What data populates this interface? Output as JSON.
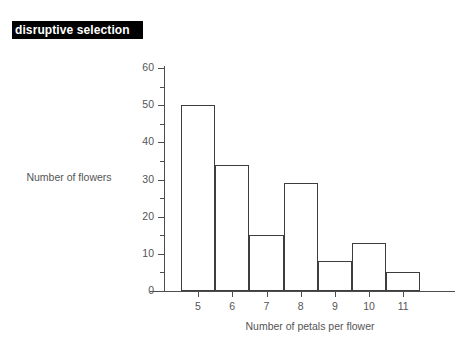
{
  "banner": {
    "title": "disruptive selection"
  },
  "chart_data": {
    "type": "bar",
    "title": "disruptive selection",
    "categories": [
      "5",
      "6",
      "7",
      "8",
      "9",
      "10",
      "11"
    ],
    "values": [
      50,
      34,
      15,
      29,
      8,
      13,
      5
    ],
    "xlabel": "Number of petals per flower",
    "ylabel": "Number of flowers",
    "ylim": [
      0,
      60
    ],
    "ytick_labels": [
      "0",
      "10",
      "20",
      "30",
      "40",
      "50",
      "60"
    ],
    "ytick_values": [
      0,
      10,
      20,
      30,
      40,
      50,
      60
    ],
    "yminor_values": [
      5,
      15,
      25,
      35,
      45,
      55
    ],
    "grid": false,
    "legend": false,
    "bar_fill_color": "#ffffff",
    "bar_edge_color": "#3d3d3d",
    "axis_color": "#4d4d4d",
    "text_color": "#555555",
    "banner_bg_color": "#000000",
    "banner_text_color": "#ffffff",
    "background_color": "#ffffff"
  }
}
